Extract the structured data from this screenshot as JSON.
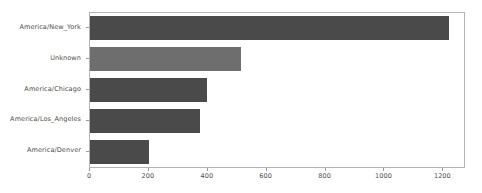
{
  "chart_data": {
    "type": "bar",
    "orientation": "horizontal",
    "title": "",
    "xlabel": "",
    "ylabel": "",
    "categories": [
      "America/New_York",
      "Unknown",
      "America/Chicago",
      "America/Los_Angeles",
      "America/Denver"
    ],
    "values": [
      1220,
      512,
      396,
      375,
      200
    ],
    "xlim": [
      0,
      1270
    ],
    "ylim": [
      0,
      5
    ],
    "xticks": [
      0,
      200,
      400,
      600,
      800,
      1000,
      1200
    ],
    "xtick_labels": [
      "0",
      "200",
      "400",
      "600",
      "800",
      "1000",
      "1200"
    ],
    "grid": false,
    "legend": null,
    "bar_colors": [
      "#4a4a4a",
      "#6e6e6e",
      "#4a4a4a",
      "#4a4a4a",
      "#4a4a4a"
    ],
    "frame_color": "#b3b3b3",
    "tick_color": "#9a9a9a",
    "text_color": "#4d4d4d",
    "background": "#ffffff"
  }
}
